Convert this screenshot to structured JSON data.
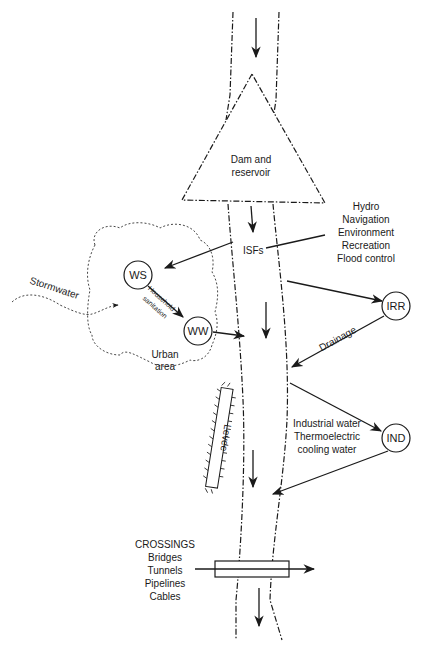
{
  "diagram": {
    "reservoir": {
      "label_line1": "Dam and",
      "label_line2": "reservoir"
    },
    "instream": {
      "isf_label": "ISFs",
      "uses": [
        "Hydro",
        "Navigation",
        "Environment",
        "Recreation",
        "Flood control"
      ]
    },
    "urban": {
      "stormwater_label": "Stormwater",
      "area_line1": "Urban",
      "area_line2": "area",
      "household_line1": "Household",
      "household_line2": "sanitation",
      "ws_label": "WS",
      "ww_label": "WW"
    },
    "irrigation": {
      "node_label": "IRR",
      "drainage_label": "Drainage"
    },
    "industrial": {
      "node_label": "IND",
      "uses": [
        "Industrial water",
        "Thermoelectric",
        "cooling water"
      ]
    },
    "levee": {
      "label": "Levee"
    },
    "crossings": {
      "title": "CROSSINGS",
      "items": [
        "Bridges",
        "Tunnels",
        "Pipelines",
        "Cables"
      ]
    },
    "colors": {
      "line": "#1a1a1a",
      "background": "#ffffff"
    }
  }
}
